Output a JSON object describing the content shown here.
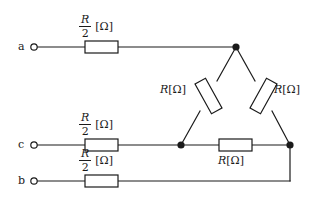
{
  "figure": {
    "line_color": "#1a1a1a",
    "background": "#ffffff"
  },
  "terminals": [
    {
      "id": "a",
      "label": "a",
      "x": 30,
      "y": 47
    },
    {
      "id": "c",
      "label": "c",
      "x": 30,
      "y": 145
    },
    {
      "id": "b",
      "label": "b",
      "x": 30,
      "y": 181
    }
  ],
  "series_resistors": [
    {
      "id": "ra",
      "value": "R",
      "denominator": "2",
      "unit": "[Ω]",
      "branch": "a"
    },
    {
      "id": "rc",
      "value": "R",
      "denominator": "2",
      "unit": "[Ω]",
      "branch": "c"
    },
    {
      "id": "rb",
      "value": "R",
      "denominator": "2",
      "unit": "[Ω]",
      "branch": "b"
    }
  ],
  "delta_resistors": [
    {
      "id": "r-left",
      "value": "R",
      "unit": "[Ω]",
      "position": "left-diagonal"
    },
    {
      "id": "r-right",
      "value": "R",
      "unit": "[Ω]",
      "position": "right-diagonal"
    },
    {
      "id": "r-bottom",
      "value": "R",
      "unit": "[Ω]",
      "position": "bottom-horizontal"
    }
  ],
  "nodes": [
    {
      "id": "apex",
      "x": 236,
      "y": 47
    },
    {
      "id": "bottom-left",
      "x": 181,
      "y": 145
    },
    {
      "id": "bottom-right",
      "x": 290,
      "y": 145
    }
  ],
  "labels": {
    "terminal_a": "a",
    "terminal_b": "b",
    "terminal_c": "c",
    "numerator": "R",
    "denominator": "2",
    "unit": "[Ω]",
    "r_symbol": "R",
    "r_unit": "[Ω]"
  }
}
